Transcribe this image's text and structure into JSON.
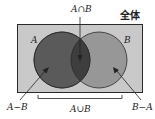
{
  "diagram": {
    "type": "venn",
    "universe_label": "全体",
    "sets": [
      {
        "name": "A",
        "label": "A"
      },
      {
        "name": "B",
        "label": "B"
      }
    ],
    "annotations": {
      "intersection": "A∩B",
      "union": "A∪B",
      "a_minus_b": "A−B",
      "b_minus_a": "B−A"
    },
    "colors": {
      "universe_fill": "#c9c9c9",
      "set_a_fill": "#5a5a5a",
      "set_b_fill": "#979797",
      "intersection_fill": "#3e3e3e",
      "stroke": "#2a2a2a"
    }
  }
}
